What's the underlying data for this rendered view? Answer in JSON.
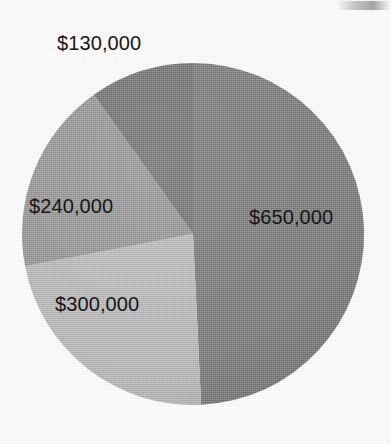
{
  "chart_data": {
    "type": "pie",
    "title": "",
    "subtitle": "",
    "xlabel": "",
    "ylabel": "",
    "grid": false,
    "legend": "none",
    "labels_position": "inside-and-outside",
    "total": 1320000,
    "currency": "$",
    "categories": [
      "$650,000",
      "$300,000",
      "$240,000",
      "$130,000"
    ],
    "values": [
      650000,
      300000,
      240000,
      130000
    ],
    "slices": [
      {
        "label": "$650,000",
        "value": 650000,
        "percent": 49.2,
        "start_angle_deg": 0,
        "end_angle_deg": 177.3,
        "color": "#737373",
        "label_inside": true
      },
      {
        "label": "$300,000",
        "value": 300000,
        "percent": 22.7,
        "start_angle_deg": 177.3,
        "end_angle_deg": 259.1,
        "color": "#b5b5b5",
        "label_inside": true
      },
      {
        "label": "$240,000",
        "value": 240000,
        "percent": 18.2,
        "start_angle_deg": 259.1,
        "end_angle_deg": 324.5,
        "color": "#8f8f8f",
        "label_inside": true
      },
      {
        "label": "$130,000",
        "value": 130000,
        "percent": 9.8,
        "start_angle_deg": 324.5,
        "end_angle_deg": 360,
        "color": "#6a6a6a",
        "label_inside": false
      }
    ]
  },
  "labels": {
    "v130000": "$130,000",
    "v240000": "$240,000",
    "v300000": "$300,000",
    "v650000": "$650,000"
  },
  "geometry": {
    "center_x": 193,
    "center_y": 234,
    "radius": 171
  },
  "colors": {
    "background": "#ffffff",
    "text": "#161616",
    "slice_650000": "#737373",
    "slice_300000": "#b5b5b5",
    "slice_240000": "#8f8f8f",
    "slice_130000": "#6a6a6a"
  }
}
